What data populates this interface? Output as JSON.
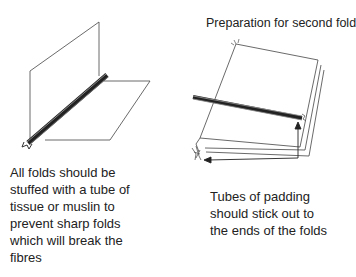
{
  "figures": {
    "left": {
      "caption": "All folds should be stuffed with a tube of tissue or muslin to prevent sharp folds which will break the fibres"
    },
    "right": {
      "title": "Preparation for second fold",
      "caption": "Tubes of padding should stick out to the ends of the folds"
    }
  },
  "colors": {
    "line": "#333333",
    "tube_dark": "#2a2a2a",
    "tube_light": "#9a9a9a",
    "text": "#222222"
  }
}
